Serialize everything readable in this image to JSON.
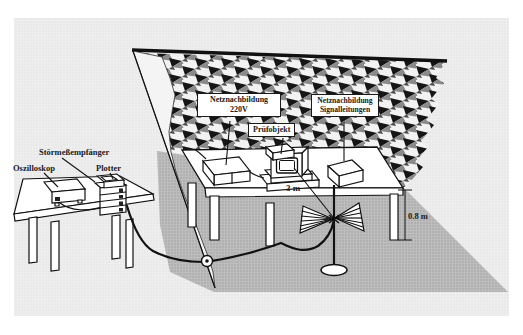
{
  "diagram": {
    "callouts": {
      "receiver": "Störmeßempfänger",
      "oscilloscope": "Oszilloskop",
      "plotter": "Plotter",
      "lisn_mains": {
        "line1": "Netznachbildung",
        "line2": "220V"
      },
      "eut": "Prüfobjekt",
      "lisn_signal": {
        "line1": "Netznachbildung",
        "line2": "Signalleitungen"
      }
    },
    "dimensions": {
      "distance": "3 m",
      "height": "0.8 m"
    },
    "colors": {
      "ink": "#1a1a1a",
      "paper": "#ffffff",
      "background_tint": "#ececec",
      "floor_shadow": "#b3b3b3",
      "absorber_dark": "#161616",
      "absorber_gray": "#8a8a8a"
    }
  }
}
